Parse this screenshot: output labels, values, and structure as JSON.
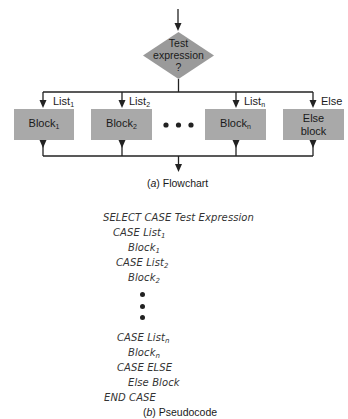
{
  "flowchart": {
    "decision": {
      "line1": "Test",
      "line2": "expression",
      "line3": "?"
    },
    "branches": [
      {
        "label": "List",
        "label_sub": "1",
        "block": "Block",
        "block_sub": "1"
      },
      {
        "label": "List",
        "label_sub": "2",
        "block": "Block",
        "block_sub": "2"
      },
      {
        "label": "List",
        "label_sub": "n",
        "block": "Block",
        "block_sub": "n"
      },
      {
        "label": "Else",
        "block_line1": "Else",
        "block_line2": "block"
      }
    ],
    "ellipsis": "• • •",
    "caption_prefix": "(",
    "caption_letter": "a",
    "caption_text": ") Flowchart",
    "colors": {
      "box_fill": "#a9a9a9",
      "diamond_fill": "#9a9a9a",
      "line": "#222222"
    }
  },
  "pseudocode": {
    "lines": [
      {
        "text": "SELECT CASE Test Expression",
        "sub": ""
      },
      {
        "text": "CASE List",
        "sub": "1"
      },
      {
        "text": "Block",
        "sub": "1"
      },
      {
        "text": "CASE List",
        "sub": "2"
      },
      {
        "text": "Block",
        "sub": "2"
      },
      {
        "text": "CASE List",
        "sub": "n"
      },
      {
        "text": "Block",
        "sub": "n"
      },
      {
        "text": "CASE ELSE",
        "sub": ""
      },
      {
        "text": "Else Block",
        "sub": ""
      },
      {
        "text": "END CASE",
        "sub": ""
      }
    ],
    "caption_prefix": "(",
    "caption_letter": "b",
    "caption_text": ") Pseudocode"
  }
}
